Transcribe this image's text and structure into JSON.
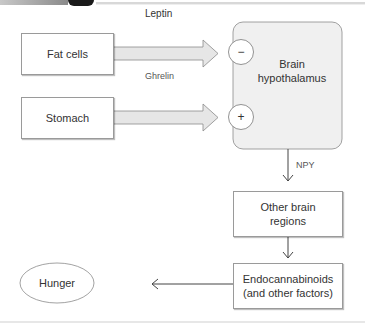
{
  "diagram": {
    "nodes": {
      "fat_cells": "Fat cells",
      "stomach": "Stomach",
      "brain_line1": "Brain",
      "brain_line2": "hypothalamus",
      "other_line1": "Other brain",
      "other_line2": "regions",
      "endo_line1": "Endocannabinoids",
      "endo_line2": "(and other factors)",
      "hunger": "Hunger"
    },
    "edges": {
      "leptin": "Leptin",
      "ghrelin": "Ghrelin",
      "npy": "NPY"
    },
    "signs": {
      "inhibit": "−",
      "excite": "+"
    }
  },
  "colors": {
    "brain_fill": "#f0f0f0",
    "border": "#9a9a9a",
    "arrow_fill": "#e6e6e6",
    "line": "#444444"
  }
}
